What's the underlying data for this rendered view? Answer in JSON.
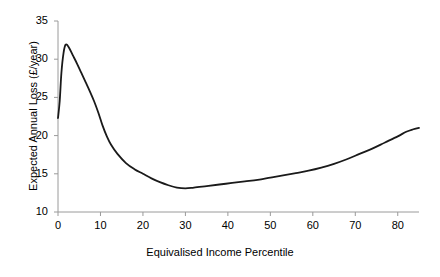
{
  "chart_data": {
    "type": "line",
    "title": "",
    "xlabel": "Equivalised Income Percentile",
    "ylabel": "Expected Annual Loss (£/year)",
    "xlim": [
      0,
      85
    ],
    "ylim": [
      10,
      35
    ],
    "xticks": [
      0,
      10,
      20,
      30,
      40,
      50,
      60,
      70,
      80
    ],
    "yticks": [
      10,
      15,
      20,
      25,
      30,
      35
    ],
    "xtick_labels": [
      "0",
      "10",
      "20",
      "30",
      "40",
      "50",
      "60",
      "70",
      "80"
    ],
    "ytick_labels": [
      "10",
      "15",
      "20",
      "25",
      "30",
      "35"
    ],
    "grid": false,
    "legend": null,
    "line_color": "#1a1a1a",
    "line_width": 1.8,
    "axis_color": "#9a9a9a",
    "series": [
      {
        "name": "Expected Annual Loss",
        "x": [
          0,
          0.4,
          0.8,
          1.3,
          1.8,
          2.5,
          3.5,
          4.5,
          5.5,
          6.5,
          7.5,
          8.5,
          9.5,
          10.5,
          11.5,
          12.5,
          14,
          16,
          18,
          20,
          22,
          24,
          26,
          28,
          30,
          32,
          35,
          38,
          41,
          44,
          47,
          50,
          53,
          56,
          59,
          62,
          65,
          68,
          71,
          74,
          77,
          80,
          82,
          83.5,
          85
        ],
        "y": [
          22.3,
          24.5,
          28.2,
          30.8,
          31.9,
          31.6,
          30.5,
          29.4,
          28.2,
          27.0,
          25.8,
          24.5,
          23.0,
          21.3,
          19.9,
          18.8,
          17.6,
          16.4,
          15.6,
          15.0,
          14.4,
          13.9,
          13.5,
          13.2,
          13.1,
          13.2,
          13.4,
          13.6,
          13.8,
          14.0,
          14.2,
          14.5,
          14.8,
          15.1,
          15.4,
          15.8,
          16.3,
          16.9,
          17.6,
          18.3,
          19.1,
          19.9,
          20.5,
          20.8,
          21.0
        ]
      }
    ]
  },
  "axes": {
    "x_title": "Equivalised Income Percentile",
    "y_title": "Expected Annual Loss (£/year)",
    "x_tick_texts": [
      "0",
      "10",
      "20",
      "30",
      "40",
      "50",
      "60",
      "70",
      "80"
    ],
    "y_tick_texts": [
      "10",
      "15",
      "20",
      "25",
      "30",
      "35"
    ]
  }
}
